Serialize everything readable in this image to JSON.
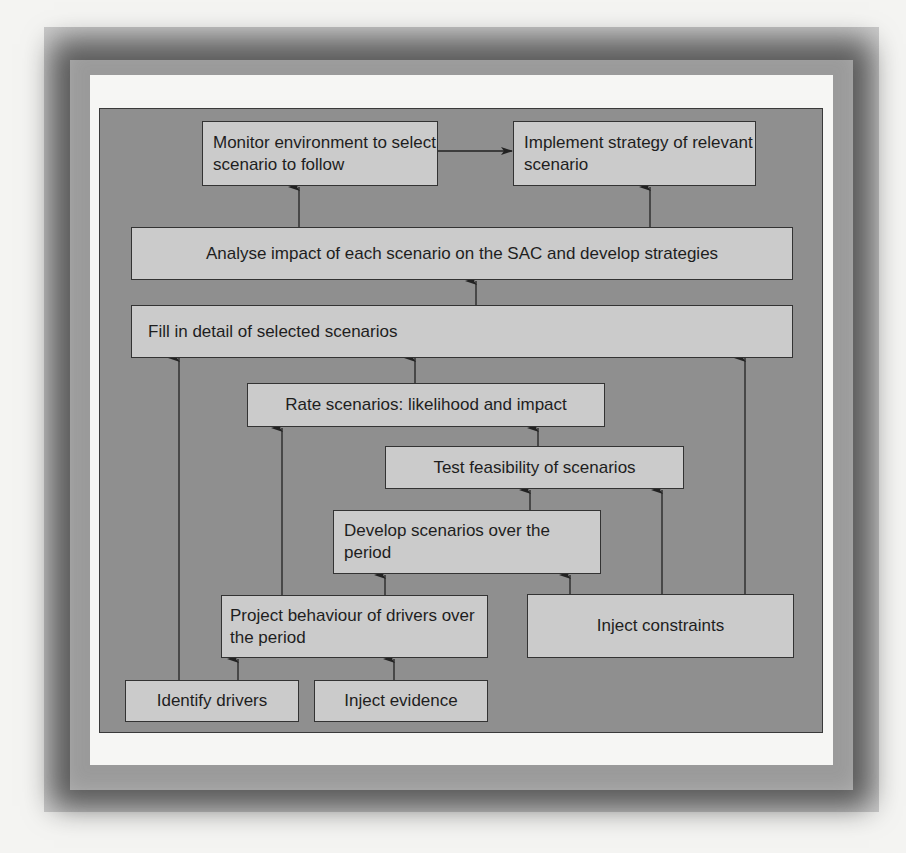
{
  "diagram": {
    "nodes": {
      "monitor": "Monitor environment to select scenario to follow",
      "implement": "Implement strategy of relevant scenario",
      "analyse": "Analyse impact of each scenario on the SAC and develop strategies",
      "fill": "Fill in detail of selected scenarios",
      "rate": "Rate scenarios: likelihood and impact",
      "test": "Test feasibility of scenarios",
      "develop": "Develop scenarios over the period",
      "project": "Project behaviour of drivers over the period",
      "constraints": "Inject constraints",
      "identify": "Identify drivers",
      "evidence": "Inject evidence"
    },
    "edges": [
      {
        "from": "monitor",
        "to": "implement"
      },
      {
        "from": "analyse",
        "to": "monitor"
      },
      {
        "from": "analyse",
        "to": "implement"
      },
      {
        "from": "fill",
        "to": "analyse"
      },
      {
        "from": "rate",
        "to": "fill"
      },
      {
        "from": "identify",
        "to": "fill"
      },
      {
        "from": "constraints",
        "to": "fill"
      },
      {
        "from": "test",
        "to": "rate"
      },
      {
        "from": "project",
        "to": "rate"
      },
      {
        "from": "develop",
        "to": "test"
      },
      {
        "from": "constraints",
        "to": "test"
      },
      {
        "from": "project",
        "to": "develop"
      },
      {
        "from": "constraints",
        "to": "develop"
      },
      {
        "from": "identify",
        "to": "project"
      },
      {
        "from": "evidence",
        "to": "project"
      }
    ],
    "colors": {
      "background": "#8f8f8f",
      "node_fill": "#cbcbcb",
      "border": "#333333"
    }
  }
}
